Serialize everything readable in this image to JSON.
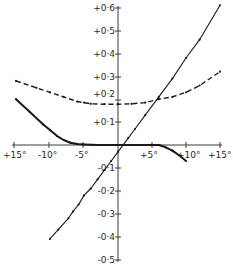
{
  "chart_data": {
    "type": "line",
    "title": "",
    "xlabel": "",
    "ylabel": "",
    "xlim": [
      -15,
      15
    ],
    "ylim": [
      -0.5,
      0.6
    ],
    "grid": false,
    "legend": null,
    "x_tick_labels": [
      "+15°",
      "-10°",
      "-5°",
      "+5°",
      "+10°",
      "+15°"
    ],
    "x_tick_values": [
      -15,
      -10,
      -5,
      5,
      10,
      15
    ],
    "y_tick_labels": [
      "+0·6",
      "+0·5",
      "+0·4",
      "+0·3",
      "+0·2",
      "+0·1",
      "-0·1",
      "-0·2",
      "-0·3",
      "-0·4",
      "-0·5"
    ],
    "y_tick_values": [
      0.6,
      0.5,
      0.4,
      0.3,
      0.2,
      0.1,
      -0.1,
      -0.2,
      -0.3,
      -0.4,
      -0.5
    ],
    "series": [
      {
        "name": "straight-line",
        "style": "solid-with-markers",
        "color": "#1a1a1a",
        "x": [
          -10,
          -8.8,
          -7.3,
          -6.6,
          -5.8,
          -5.0,
          -4.0,
          -3.0,
          -2.0,
          -1.0,
          0,
          1.5,
          2.5,
          4.0,
          6.0,
          8.0,
          10.0,
          12.0,
          15.0
        ],
        "y": [
          -0.41,
          -0.37,
          -0.32,
          -0.29,
          -0.26,
          -0.22,
          -0.19,
          -0.15,
          -0.11,
          -0.07,
          -0.03,
          0.03,
          0.07,
          0.13,
          0.21,
          0.29,
          0.38,
          0.46,
          0.61
        ]
      },
      {
        "name": "dashed-curve",
        "style": "dashed-with-markers",
        "color": "#1a1a1a",
        "x": [
          -15,
          -12,
          -10,
          -8,
          -6,
          -5,
          -4,
          -2,
          0,
          2,
          4,
          6,
          8,
          10,
          12,
          15
        ],
        "y": [
          0.28,
          0.25,
          0.23,
          0.21,
          0.19,
          0.185,
          0.18,
          0.178,
          0.178,
          0.18,
          0.185,
          0.2,
          0.21,
          0.23,
          0.26,
          0.32
        ]
      },
      {
        "name": "solid-curve",
        "style": "solid-thick-with-markers",
        "color": "#1a1a1a",
        "x": [
          -15,
          -13,
          -11,
          -10,
          -9,
          -8,
          -7,
          -6,
          -5,
          -4,
          -3,
          -2,
          -1,
          0,
          1,
          2,
          3,
          4,
          5,
          6,
          7,
          8,
          9,
          10
        ],
        "y": [
          0.2,
          0.145,
          0.09,
          0.065,
          0.04,
          0.022,
          0.01,
          0.004,
          0.002,
          0.001,
          0.0,
          0.0,
          0.0,
          0.0,
          0.0,
          0.0,
          0.0,
          0.0,
          0.0,
          0.0,
          -0.01,
          -0.025,
          -0.045,
          -0.07
        ]
      }
    ]
  },
  "axis_labels": {
    "x": [
      "+15°",
      "-10°",
      "-5°",
      "+5°",
      "+10°",
      "+15°"
    ],
    "y": [
      "+0·6",
      "+0·5",
      "+0·4",
      "+0·3",
      "+0·2",
      "+0·1",
      "-0·1",
      "-0·2",
      "-0·3",
      "-0·4",
      "-0·5"
    ]
  }
}
